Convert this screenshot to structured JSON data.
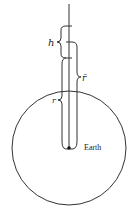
{
  "diagram": {
    "type": "geometry-physics",
    "labels": {
      "h": "h",
      "r_bar": "r̄",
      "r": "r",
      "earth": "Earth"
    },
    "geometry": {
      "earth_center": [
        69,
        148
      ],
      "earth_radius": 57,
      "radial_line_top": 5,
      "ticks_y": [
        26,
        42,
        58
      ]
    },
    "colors": {
      "stroke": "#333333",
      "background": "#ffffff"
    }
  }
}
